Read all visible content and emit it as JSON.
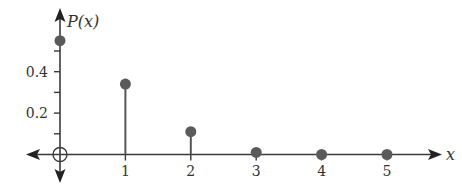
{
  "chart_data": {
    "type": "bar",
    "subtype": "stem",
    "title": "",
    "xlabel": "x",
    "ylabel": "P(x)",
    "categories": [
      "0",
      "1",
      "2",
      "3",
      "4",
      "5"
    ],
    "x": [
      0,
      1,
      2,
      3,
      4,
      5
    ],
    "values": [
      0.55,
      0.34,
      0.11,
      0.01,
      0.0,
      0.0
    ],
    "x_tick_labels": [
      "1",
      "2",
      "3",
      "4",
      "5"
    ],
    "y_ticks": [
      0.1,
      0.2,
      0.3,
      0.4,
      0.5
    ],
    "y_tick_labels": [
      "0.2",
      "0.4"
    ],
    "ylim": [
      0,
      0.7
    ],
    "xlim": [
      -0.5,
      5.8
    ],
    "grid": false,
    "legend": null,
    "origin_marker": "circle",
    "colors": {
      "points": "#5a5a5a",
      "axes": "#3a3a3a"
    }
  }
}
